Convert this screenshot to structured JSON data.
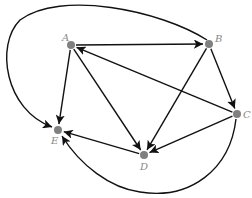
{
  "diagram": {
    "type": "directed-graph",
    "colors": {
      "node": "#808080",
      "edge": "#111111",
      "label": "#888888",
      "background": "#ffffff"
    },
    "nodes": [
      {
        "id": "A",
        "label": "A",
        "x": 71,
        "y": 45,
        "lx": 62,
        "ly": 41
      },
      {
        "id": "B",
        "label": "B",
        "x": 209,
        "y": 44,
        "lx": 215,
        "ly": 42
      },
      {
        "id": "C",
        "label": "C",
        "x": 237,
        "y": 114,
        "lx": 243,
        "ly": 118
      },
      {
        "id": "D",
        "label": "D",
        "x": 144,
        "y": 155,
        "lx": 140,
        "ly": 170
      },
      {
        "id": "E",
        "label": "E",
        "x": 58,
        "y": 130,
        "lx": 51,
        "ly": 144
      }
    ],
    "edges": [
      {
        "from": "A",
        "to": "B"
      },
      {
        "from": "C",
        "to": "A"
      },
      {
        "from": "A",
        "to": "E"
      },
      {
        "from": "A",
        "to": "D"
      },
      {
        "from": "B",
        "to": "D"
      },
      {
        "from": "B",
        "to": "C"
      },
      {
        "from": "C",
        "to": "D"
      },
      {
        "from": "D",
        "to": "E"
      },
      {
        "from": "B",
        "to": "E",
        "curved": true,
        "path": "M 207 40 C 160 10, 60 -10, 20 20 C -5 45, 5 110, 52 127"
      },
      {
        "from": "C",
        "to": "E",
        "curved": true,
        "path": "M 236 119 C 230 170, 190 200, 140 192 C 110 188, 80 165, 62 136"
      }
    ]
  }
}
